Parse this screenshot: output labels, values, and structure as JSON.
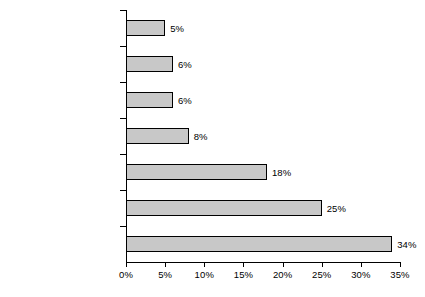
{
  "chart_data": {
    "type": "bar",
    "orientation": "horizontal",
    "title": "",
    "subtitle": "",
    "xlabel": "",
    "ylabel": "",
    "grid": false,
    "legend": null,
    "xlim": [
      0,
      35
    ],
    "x_tick_labels": [
      "0%",
      "5%",
      "10%",
      "15%",
      "20%",
      "25%",
      "30%",
      "35%"
    ],
    "x_ticks": [
      0,
      5,
      10,
      15,
      20,
      25,
      30,
      35
    ],
    "categories": [
      "Homeless",
      "Hospitals",
      "Jails",
      "Nursing homes",
      "Supervised living",
      "Living with family member",
      "Unsupervised living"
    ],
    "values": [
      5,
      6,
      6,
      8,
      18,
      25,
      34
    ],
    "data_labels": [
      "5%",
      "6%",
      "6%",
      "8%",
      "18%",
      "25%",
      "34%"
    ],
    "colors": {
      "bar_fill": "#c8c8c8",
      "bar_border": "#000000",
      "axis": "#000000",
      "text": "#000000",
      "background": "#ffffff"
    }
  }
}
